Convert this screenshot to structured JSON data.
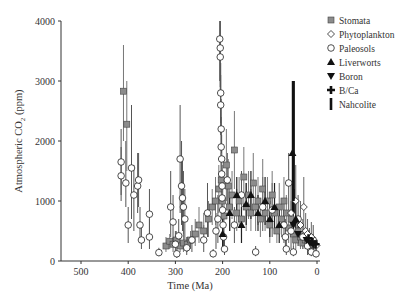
{
  "chart_data": {
    "type": "scatter",
    "title": "",
    "xlabel": "Time (Ma)",
    "ylabel": "Atmospheric CO2 (ppm)",
    "ylabel_parts": {
      "pre": "Atmospheric CO",
      "sub": "2",
      "post": " (ppm)"
    },
    "xlim": [
      540,
      -5
    ],
    "ylim": [
      0,
      4000
    ],
    "x_reversed": true,
    "x_ticks": [
      500,
      400,
      300,
      200,
      100,
      0
    ],
    "y_ticks": [
      0,
      1000,
      2000,
      3000,
      4000
    ],
    "grid": false,
    "legend_position": "upper right",
    "legend": [
      {
        "name": "Stomata",
        "marker": "square-gray"
      },
      {
        "name": "Phytoplankton",
        "marker": "diamond-open"
      },
      {
        "name": "Paleosols",
        "marker": "circle-open"
      },
      {
        "name": "Liverworts",
        "marker": "triangle-up-filled"
      },
      {
        "name": "Boron",
        "marker": "triangle-down-filled"
      },
      {
        "name": "B/Ca",
        "marker": "cross-filled"
      },
      {
        "name": "Nahcolite",
        "marker": "bar-filled"
      }
    ],
    "series": [
      {
        "name": "Paleosols",
        "points": [
          {
            "x": 415,
            "y": 1650,
            "lo": 1100,
            "hi": 2200
          },
          {
            "x": 415,
            "y": 1420,
            "lo": 1000,
            "hi": 1900
          },
          {
            "x": 405,
            "y": 1300,
            "lo": 900,
            "hi": 2000
          },
          {
            "x": 400,
            "y": 600,
            "lo": 300,
            "hi": 900
          },
          {
            "x": 393,
            "y": 1550,
            "lo": 700,
            "hi": 2600
          },
          {
            "x": 388,
            "y": 1100,
            "lo": 500,
            "hi": 1600
          },
          {
            "x": 380,
            "y": 1250,
            "lo": 800,
            "hi": 1800
          },
          {
            "x": 378,
            "y": 1350,
            "lo": 900,
            "hi": 1800
          },
          {
            "x": 375,
            "y": 600,
            "lo": 300,
            "hi": 900
          },
          {
            "x": 372,
            "y": 350,
            "lo": 200,
            "hi": 600
          },
          {
            "x": 355,
            "y": 780,
            "lo": 400,
            "hi": 1200
          },
          {
            "x": 355,
            "y": 400,
            "lo": 200,
            "hi": 700
          },
          {
            "x": 335,
            "y": 140,
            "lo": 80,
            "hi": 220
          },
          {
            "x": 310,
            "y": 900,
            "lo": 400,
            "hi": 1500
          },
          {
            "x": 305,
            "y": 650,
            "lo": 300,
            "hi": 1100
          },
          {
            "x": 300,
            "y": 280,
            "lo": 100,
            "hi": 500
          },
          {
            "x": 297,
            "y": 120,
            "lo": 50,
            "hi": 200
          },
          {
            "x": 293,
            "y": 420,
            "lo": 200,
            "hi": 700
          },
          {
            "x": 290,
            "y": 1700,
            "lo": 800,
            "hi": 2600
          },
          {
            "x": 287,
            "y": 1250,
            "lo": 600,
            "hi": 2000
          },
          {
            "x": 285,
            "y": 1050,
            "lo": 500,
            "hi": 1700
          },
          {
            "x": 283,
            "y": 900,
            "lo": 400,
            "hi": 1500
          },
          {
            "x": 280,
            "y": 700,
            "lo": 300,
            "hi": 1200
          },
          {
            "x": 276,
            "y": 220,
            "lo": 100,
            "hi": 400
          },
          {
            "x": 265,
            "y": 350,
            "lo": 150,
            "hi": 600
          },
          {
            "x": 240,
            "y": 350,
            "lo": 150,
            "hi": 600
          },
          {
            "x": 220,
            "y": 120,
            "lo": 60,
            "hi": 200
          },
          {
            "x": 232,
            "y": 800,
            "lo": 400,
            "hi": 1300
          },
          {
            "x": 206,
            "y": 3700,
            "lo": 3000,
            "hi": 4000
          },
          {
            "x": 205,
            "y": 3550,
            "lo": 2900,
            "hi": 4000
          },
          {
            "x": 205,
            "y": 3400,
            "lo": 2800,
            "hi": 4000
          },
          {
            "x": 204,
            "y": 2800,
            "lo": 2300,
            "hi": 3300
          },
          {
            "x": 204,
            "y": 2600,
            "lo": 2100,
            "hi": 3100
          },
          {
            "x": 203,
            "y": 2200,
            "lo": 1700,
            "hi": 2700
          },
          {
            "x": 203,
            "y": 1900,
            "lo": 1500,
            "hi": 2400
          },
          {
            "x": 202,
            "y": 1700,
            "lo": 1300,
            "hi": 2100
          },
          {
            "x": 202,
            "y": 1450,
            "lo": 1100,
            "hi": 1900
          },
          {
            "x": 201,
            "y": 1250,
            "lo": 900,
            "hi": 1600
          },
          {
            "x": 201,
            "y": 1050,
            "lo": 700,
            "hi": 1400
          },
          {
            "x": 200,
            "y": 850,
            "lo": 500,
            "hi": 1200
          },
          {
            "x": 199,
            "y": 600,
            "lo": 300,
            "hi": 900
          },
          {
            "x": 198,
            "y": 400,
            "lo": 200,
            "hi": 600
          },
          {
            "x": 196,
            "y": 200,
            "lo": 100,
            "hi": 350
          },
          {
            "x": 210,
            "y": 700,
            "lo": 300,
            "hi": 1100
          },
          {
            "x": 214,
            "y": 500,
            "lo": 200,
            "hi": 800
          },
          {
            "x": 190,
            "y": 1350,
            "lo": 900,
            "hi": 1800
          },
          {
            "x": 175,
            "y": 600,
            "lo": 300,
            "hi": 900
          },
          {
            "x": 160,
            "y": 1100,
            "lo": 700,
            "hi": 1500
          },
          {
            "x": 130,
            "y": 150,
            "lo": 80,
            "hi": 250
          },
          {
            "x": 115,
            "y": 900,
            "lo": 500,
            "hi": 1400
          },
          {
            "x": 95,
            "y": 850,
            "lo": 400,
            "hi": 1300
          },
          {
            "x": 70,
            "y": 600,
            "lo": 300,
            "hi": 1000
          },
          {
            "x": 67,
            "y": 400,
            "lo": 200,
            "hi": 700
          },
          {
            "x": 65,
            "y": 200,
            "lo": 100,
            "hi": 350
          },
          {
            "x": 60,
            "y": 1300,
            "lo": 800,
            "hi": 1800
          },
          {
            "x": 55,
            "y": 500,
            "lo": 200,
            "hi": 800
          },
          {
            "x": 50,
            "y": 150,
            "lo": 80,
            "hi": 250
          },
          {
            "x": 40,
            "y": 700,
            "lo": 300,
            "hi": 1100
          },
          {
            "x": 30,
            "y": 400,
            "lo": 200,
            "hi": 700
          },
          {
            "x": 20,
            "y": 250,
            "lo": 100,
            "hi": 400
          },
          {
            "x": 12,
            "y": 150,
            "lo": 80,
            "hi": 250
          },
          {
            "x": 8,
            "y": 350,
            "lo": 150,
            "hi": 600
          },
          {
            "x": 2,
            "y": 120,
            "lo": 60,
            "hi": 200
          }
        ]
      },
      {
        "name": "Stomata",
        "points": [
          {
            "x": 410,
            "y": 2830,
            "lo": 2000,
            "hi": 3600
          },
          {
            "x": 403,
            "y": 2280,
            "lo": 1500,
            "hi": 3000
          },
          {
            "x": 320,
            "y": 250,
            "lo": 150,
            "hi": 400
          },
          {
            "x": 312,
            "y": 330,
            "lo": 200,
            "hi": 450
          },
          {
            "x": 305,
            "y": 280,
            "lo": 150,
            "hi": 400
          },
          {
            "x": 298,
            "y": 350,
            "lo": 200,
            "hi": 500
          },
          {
            "x": 290,
            "y": 250,
            "lo": 150,
            "hi": 400
          },
          {
            "x": 283,
            "y": 300,
            "lo": 150,
            "hi": 450
          },
          {
            "x": 275,
            "y": 280,
            "lo": 150,
            "hi": 400
          },
          {
            "x": 268,
            "y": 350,
            "lo": 200,
            "hi": 500
          },
          {
            "x": 258,
            "y": 450,
            "lo": 250,
            "hi": 700
          },
          {
            "x": 250,
            "y": 600,
            "lo": 300,
            "hi": 900
          },
          {
            "x": 240,
            "y": 500,
            "lo": 300,
            "hi": 800
          },
          {
            "x": 230,
            "y": 700,
            "lo": 400,
            "hi": 1000
          },
          {
            "x": 222,
            "y": 900,
            "lo": 600,
            "hi": 1200
          },
          {
            "x": 215,
            "y": 1000,
            "lo": 600,
            "hi": 1400
          },
          {
            "x": 208,
            "y": 1200,
            "lo": 800,
            "hi": 1600
          },
          {
            "x": 203,
            "y": 1350,
            "lo": 900,
            "hi": 1800
          },
          {
            "x": 200,
            "y": 1000,
            "lo": 600,
            "hi": 1400
          },
          {
            "x": 197,
            "y": 750,
            "lo": 400,
            "hi": 1100
          },
          {
            "x": 192,
            "y": 1600,
            "lo": 1000,
            "hi": 2200
          },
          {
            "x": 188,
            "y": 1250,
            "lo": 800,
            "hi": 1700
          },
          {
            "x": 185,
            "y": 900,
            "lo": 500,
            "hi": 1300
          },
          {
            "x": 180,
            "y": 1100,
            "lo": 700,
            "hi": 1500
          },
          {
            "x": 175,
            "y": 1850,
            "lo": 1200,
            "hi": 2500
          },
          {
            "x": 170,
            "y": 800,
            "lo": 500,
            "hi": 1200
          },
          {
            "x": 165,
            "y": 1000,
            "lo": 600,
            "hi": 1400
          },
          {
            "x": 160,
            "y": 700,
            "lo": 400,
            "hi": 1000
          },
          {
            "x": 155,
            "y": 1400,
            "lo": 900,
            "hi": 1900
          },
          {
            "x": 150,
            "y": 900,
            "lo": 500,
            "hi": 1300
          },
          {
            "x": 145,
            "y": 1100,
            "lo": 700,
            "hi": 1500
          },
          {
            "x": 140,
            "y": 800,
            "lo": 500,
            "hi": 1200
          },
          {
            "x": 135,
            "y": 1300,
            "lo": 800,
            "hi": 1800
          },
          {
            "x": 130,
            "y": 900,
            "lo": 500,
            "hi": 1300
          },
          {
            "x": 125,
            "y": 1000,
            "lo": 600,
            "hi": 1400
          },
          {
            "x": 120,
            "y": 700,
            "lo": 400,
            "hi": 1000
          },
          {
            "x": 115,
            "y": 1200,
            "lo": 800,
            "hi": 1700
          },
          {
            "x": 110,
            "y": 800,
            "lo": 500,
            "hi": 1200
          },
          {
            "x": 105,
            "y": 1000,
            "lo": 600,
            "hi": 1400
          },
          {
            "x": 100,
            "y": 600,
            "lo": 300,
            "hi": 900
          },
          {
            "x": 95,
            "y": 1100,
            "lo": 700,
            "hi": 1500
          },
          {
            "x": 90,
            "y": 800,
            "lo": 500,
            "hi": 1100
          },
          {
            "x": 85,
            "y": 500,
            "lo": 300,
            "hi": 800
          },
          {
            "x": 80,
            "y": 900,
            "lo": 500,
            "hi": 1300
          },
          {
            "x": 75,
            "y": 700,
            "lo": 400,
            "hi": 1000
          },
          {
            "x": 70,
            "y": 1000,
            "lo": 600,
            "hi": 1400
          },
          {
            "x": 65,
            "y": 800,
            "lo": 500,
            "hi": 1100
          },
          {
            "x": 60,
            "y": 550,
            "lo": 300,
            "hi": 800
          },
          {
            "x": 55,
            "y": 700,
            "lo": 400,
            "hi": 1000
          },
          {
            "x": 50,
            "y": 450,
            "lo": 250,
            "hi": 700
          },
          {
            "x": 45,
            "y": 350,
            "lo": 200,
            "hi": 550
          },
          {
            "x": 40,
            "y": 500,
            "lo": 300,
            "hi": 700
          },
          {
            "x": 35,
            "y": 400,
            "lo": 200,
            "hi": 600
          },
          {
            "x": 30,
            "y": 300,
            "lo": 200,
            "hi": 450
          },
          {
            "x": 25,
            "y": 350,
            "lo": 200,
            "hi": 500
          },
          {
            "x": 20,
            "y": 300,
            "lo": 200,
            "hi": 420
          },
          {
            "x": 15,
            "y": 280,
            "lo": 180,
            "hi": 400
          },
          {
            "x": 10,
            "y": 320,
            "lo": 200,
            "hi": 450
          },
          {
            "x": 5,
            "y": 300,
            "lo": 200,
            "hi": 400
          }
        ]
      },
      {
        "name": "Phytoplankton",
        "points": [
          {
            "x": 55,
            "y": 800,
            "lo": 400,
            "hi": 1300
          },
          {
            "x": 45,
            "y": 1000,
            "lo": 500,
            "hi": 1600
          },
          {
            "x": 35,
            "y": 600,
            "lo": 300,
            "hi": 1000
          },
          {
            "x": 28,
            "y": 900,
            "lo": 500,
            "hi": 1400
          },
          {
            "x": 24,
            "y": 500,
            "lo": 250,
            "hi": 800
          },
          {
            "x": 20,
            "y": 450,
            "lo": 250,
            "hi": 700
          },
          {
            "x": 16,
            "y": 350,
            "lo": 200,
            "hi": 550
          },
          {
            "x": 12,
            "y": 400,
            "lo": 200,
            "hi": 650
          },
          {
            "x": 8,
            "y": 300,
            "lo": 180,
            "hi": 450
          },
          {
            "x": 4,
            "y": 280,
            "lo": 180,
            "hi": 400
          },
          {
            "x": 1,
            "y": 260,
            "lo": 180,
            "hi": 350
          }
        ]
      },
      {
        "name": "Liverworts",
        "points": [
          {
            "x": 200,
            "y": 450,
            "lo": 200,
            "hi": 700
          },
          {
            "x": 185,
            "y": 800,
            "lo": 500,
            "hi": 1100
          },
          {
            "x": 170,
            "y": 1100,
            "lo": 800,
            "hi": 1400
          },
          {
            "x": 160,
            "y": 600,
            "lo": 300,
            "hi": 900
          },
          {
            "x": 150,
            "y": 950,
            "lo": 600,
            "hi": 1300
          },
          {
            "x": 140,
            "y": 1100,
            "lo": 700,
            "hi": 1500
          },
          {
            "x": 125,
            "y": 800,
            "lo": 500,
            "hi": 1100
          },
          {
            "x": 110,
            "y": 1000,
            "lo": 600,
            "hi": 1400
          },
          {
            "x": 100,
            "y": 700,
            "lo": 400,
            "hi": 1000
          },
          {
            "x": 90,
            "y": 900,
            "lo": 500,
            "hi": 1300
          },
          {
            "x": 80,
            "y": 600,
            "lo": 300,
            "hi": 900
          },
          {
            "x": 52,
            "y": 1800,
            "lo": 800,
            "hi": 3000
          },
          {
            "x": 45,
            "y": 700,
            "lo": 400,
            "hi": 1000
          }
        ]
      },
      {
        "name": "Boron",
        "points": [
          {
            "x": 50,
            "y": 600,
            "lo": 300,
            "hi": 1000
          },
          {
            "x": 40,
            "y": 450,
            "lo": 250,
            "hi": 700
          },
          {
            "x": 22,
            "y": 350,
            "lo": 200,
            "hi": 500
          },
          {
            "x": 15,
            "y": 300,
            "lo": 200,
            "hi": 400
          },
          {
            "x": 8,
            "y": 280,
            "lo": 200,
            "hi": 380
          }
        ]
      },
      {
        "name": "B/Ca",
        "points": [
          {
            "x": 18,
            "y": 380,
            "lo": 250,
            "hi": 500
          },
          {
            "x": 10,
            "y": 320,
            "lo": 220,
            "hi": 420
          },
          {
            "x": 3,
            "y": 280,
            "lo": 200,
            "hi": 350
          }
        ]
      },
      {
        "name": "Nahcolite",
        "points": [
          {
            "x": 50,
            "y": 1100,
            "lo": 800,
            "hi": 3000
          }
        ]
      }
    ]
  }
}
